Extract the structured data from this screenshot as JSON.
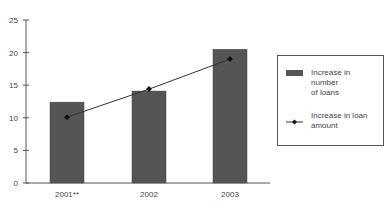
{
  "chart_data": {
    "type": "bar",
    "title": "",
    "xlabel": "",
    "ylabel": "",
    "ylim": [
      0,
      25
    ],
    "yticks": [
      0,
      5,
      10,
      15,
      20,
      25
    ],
    "grid": false,
    "legend_position": "right",
    "categories": [
      "2001**",
      "2002",
      "2003"
    ],
    "series": [
      {
        "name": "Increase in number of loans",
        "type": "bar",
        "color": "#555555",
        "values": [
          12.4,
          14.1,
          20.5
        ]
      },
      {
        "name": "Increase in loan amount",
        "type": "line",
        "marker": "diamond",
        "color": "#333333",
        "values": [
          10.1,
          14.4,
          19.0
        ]
      }
    ]
  },
  "legend": {
    "items": [
      {
        "label_line1": "Increase in number",
        "label_line2": "of loans"
      },
      {
        "label_line1": "Increase in loan",
        "label_line2": "amount"
      }
    ]
  }
}
